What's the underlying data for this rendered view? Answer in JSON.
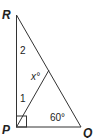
{
  "diagram": {
    "type": "geometry-triangle",
    "vertices": {
      "R": {
        "label": "R"
      },
      "P": {
        "label": "P"
      },
      "Q": {
        "label": "Q"
      }
    },
    "angle_labels": {
      "angle_1": "1",
      "angle_2": "2",
      "angle_x": "x°",
      "angle_Q": "60°"
    },
    "right_angle_at": "P",
    "line_color": "#333333"
  }
}
